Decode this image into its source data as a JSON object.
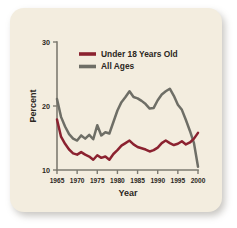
{
  "card": {
    "background_color": "#F3EDDF",
    "page_background_color": "#FFFFFF"
  },
  "chart_data": {
    "type": "line",
    "title": "",
    "xlabel": "Year",
    "ylabel": "Percent",
    "xlim": [
      1965,
      2000
    ],
    "ylim": [
      10,
      30
    ],
    "yticks": [
      10,
      20,
      30
    ],
    "ytick_labels": [
      "10",
      "20",
      "30"
    ],
    "xticks": [
      1965,
      1970,
      1975,
      1980,
      1985,
      1990,
      1995,
      2000
    ],
    "xtick_labels": [
      "1965",
      "1970",
      "1975",
      "1980",
      "1985",
      "1990",
      "1995",
      "2000"
    ],
    "grid": false,
    "legend_position": "top-center",
    "x": [
      1965,
      1966,
      1967,
      1968,
      1969,
      1970,
      1971,
      1972,
      1973,
      1974,
      1975,
      1976,
      1977,
      1978,
      1979,
      1980,
      1981,
      1982,
      1983,
      1984,
      1985,
      1986,
      1987,
      1988,
      1989,
      1990,
      1991,
      1992,
      1993,
      1994,
      1995,
      1996,
      1997,
      1998,
      1999,
      2000
    ],
    "series": [
      {
        "name": "Under 18 Years Old",
        "color": "#8B2230",
        "values": [
          17.9,
          15.2,
          14.1,
          13.2,
          12.6,
          12.4,
          12.8,
          12.4,
          12.1,
          11.6,
          12.3,
          11.9,
          12.1,
          11.6,
          12.5,
          13.1,
          13.8,
          14.2,
          14.6,
          14.0,
          13.6,
          13.4,
          13.2,
          12.9,
          13.1,
          13.5,
          14.2,
          14.6,
          14.2,
          13.9,
          14.1,
          14.5,
          14.0,
          14.3,
          14.9,
          15.8
        ]
      },
      {
        "name": "All Ages",
        "color": "#6E6E66",
        "values": [
          21.1,
          18.3,
          16.8,
          15.6,
          14.9,
          14.6,
          15.4,
          14.9,
          15.5,
          14.8,
          17.0,
          15.4,
          15.9,
          15.7,
          17.5,
          19.3,
          20.6,
          21.4,
          22.3,
          21.4,
          21.2,
          20.8,
          20.3,
          19.6,
          19.7,
          20.9,
          21.8,
          22.3,
          22.7,
          21.6,
          20.2,
          19.4,
          17.8,
          16.1,
          14.2,
          10.5
        ]
      }
    ],
    "legend": [
      {
        "label": "Under 18 Years Old",
        "color": "#8B2230"
      },
      {
        "label": "All Ages",
        "color": "#6E6E66"
      }
    ]
  }
}
